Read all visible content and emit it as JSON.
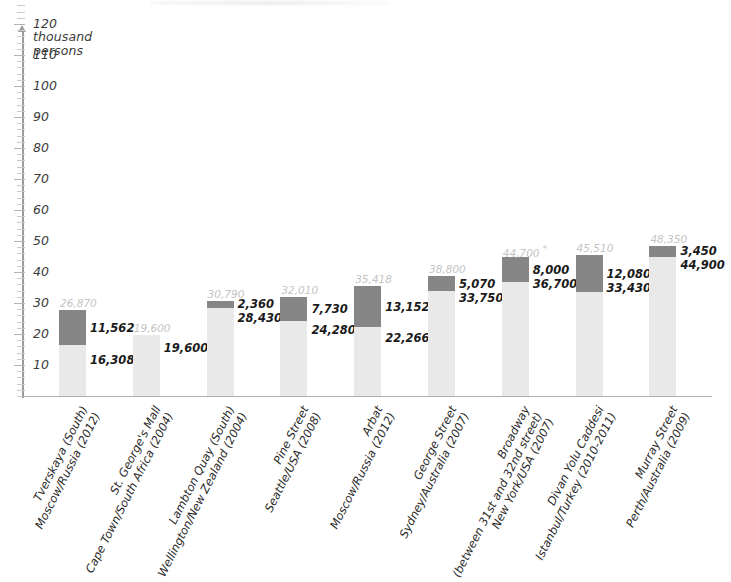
{
  "chart_data": {
    "type": "bar",
    "subtype": "stacked",
    "title": "",
    "xlabel": "",
    "ylabel": "thousand\npersons",
    "ylim": [
      0,
      135
    ],
    "ytick_step": 10,
    "ytick_minor_step": 2,
    "grid": false,
    "legend": "none",
    "yticks": [
      "130",
      "120",
      "110",
      "100",
      "90",
      "80",
      "70",
      "60",
      "50",
      "40",
      "30",
      "20",
      "10"
    ],
    "categories": [
      "Tverskaya (South)\nMoscow/Russia (2012)",
      "St. George's Mall\nCape Town/South Africa (2004)",
      "Lambton Quay (South)\nWellington/New Zealand (2004)",
      "Pine Street\nSeattle/USA (2008)",
      "Arbat\nMoscow/Russia (2012)",
      "George Street\nSydney/Australia (2007)",
      "Broadway\n(between 31st and 32nd street)\nNew York/USA (2007)",
      "Divan Yolu Caddesi\nIstanbul/Turkey (2010-2011)",
      "Murray Street\nPerth/Australia (2009)"
    ],
    "series": [
      {
        "name": "lower-segment",
        "color": "#e9e9e9",
        "values": [
          16308,
          19600,
          28430,
          24280,
          22266,
          33750,
          36700,
          33430,
          44900
        ]
      },
      {
        "name": "upper-segment",
        "color": "#868686",
        "values": [
          11562,
          0,
          2360,
          7730,
          13152,
          5070,
          8000,
          12080,
          3450
        ]
      }
    ],
    "totals": [
      26870,
      19600,
      30790,
      32010,
      35418,
      38800,
      44700,
      45510,
      48350
    ],
    "bars": [
      {
        "street": "Tverskaya (South)",
        "location": "Moscow/Russia (2012)",
        "lines": [
          "Tverskaya (South)",
          "Moscow/Russia (2012)"
        ],
        "total_label": "26,870",
        "dark_label": "11,562",
        "light_label": "16,308",
        "total": 26870,
        "dark": 11562,
        "light": 16308,
        "asterisk": false
      },
      {
        "street": "St. George's Mall",
        "location": "Cape Town/South Africa (2004)",
        "lines": [
          "St. George's Mall",
          "Cape Town/South Africa (2004)"
        ],
        "total_label": "19,600",
        "dark_label": "",
        "light_label": "19,600",
        "total": 19600,
        "dark": 0,
        "light": 19600,
        "asterisk": false
      },
      {
        "street": "Lambton Quay (South)",
        "location": "Wellington/New Zealand (2004)",
        "lines": [
          "Lambton Quay (South)",
          "Wellington/New Zealand (2004)"
        ],
        "total_label": "30,790",
        "dark_label": "2,360",
        "light_label": "28,430",
        "total": 30790,
        "dark": 2360,
        "light": 28430,
        "asterisk": false
      },
      {
        "street": "Pine Street",
        "location": "Seattle/USA (2008)",
        "lines": [
          "Pine Street",
          "Seattle/USA (2008)"
        ],
        "total_label": "32,010",
        "dark_label": "7,730",
        "light_label": "24,280",
        "total": 32010,
        "dark": 7730,
        "light": 24280,
        "asterisk": false
      },
      {
        "street": "Arbat",
        "location": "Moscow/Russia (2012)",
        "lines": [
          "Arbat",
          "Moscow/Russia (2012)"
        ],
        "total_label": "35,418",
        "dark_label": "13,152",
        "light_label": "22,266",
        "total": 35418,
        "dark": 13152,
        "light": 22266,
        "asterisk": false
      },
      {
        "street": "George Street",
        "location": "Sydney/Australia (2007)",
        "lines": [
          "George Street",
          "Sydney/Australia (2007)"
        ],
        "total_label": "38,800",
        "dark_label": "5,070",
        "light_label": "33,750",
        "total": 38800,
        "dark": 5070,
        "light": 33750,
        "asterisk": false
      },
      {
        "street": "Broadway",
        "location": "New York/USA (2007)",
        "lines": [
          "Broadway",
          "(between 31st and 32nd street)",
          "New York/USA (2007)"
        ],
        "total_label": "44,700",
        "dark_label": "8,000",
        "light_label": "36,700",
        "total": 44700,
        "dark": 8000,
        "light": 36700,
        "asterisk": true
      },
      {
        "street": "Divan Yolu Caddesi",
        "location": "Istanbul/Turkey (2010-2011)",
        "lines": [
          "Divan Yolu Caddesi",
          "Istanbul/Turkey (2010-2011)"
        ],
        "total_label": "45,510",
        "dark_label": "12,080",
        "light_label": "33,430",
        "total": 45510,
        "dark": 12080,
        "light": 33430,
        "asterisk": false
      },
      {
        "street": "Murray Street",
        "location": "Perth/Australia (2009)",
        "lines": [
          "Murray Street",
          "Perth/Australia (2009)"
        ],
        "total_label": "48,350",
        "dark_label": "3,450",
        "light_label": "44,900",
        "total": 48350,
        "dark": 3450,
        "light": 44900,
        "asterisk": false
      }
    ],
    "colors": {
      "segment_lower": "#e9e9e9",
      "segment_upper": "#868686",
      "total_label": "#c4c4c4",
      "value_label": "#1a1a1a",
      "axis": "#9b9b9b",
      "tick_label": "#3b3b3b"
    },
    "footnote_marker": "*"
  }
}
